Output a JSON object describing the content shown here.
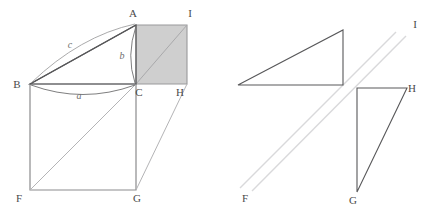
{
  "figure": {
    "canvas": {
      "width": 440,
      "height": 217
    },
    "colors": {
      "stroke_dark": "#58585a",
      "stroke_mid": "#8b8b8d",
      "stroke_light": "#c9c9cb",
      "shade_fill": "#cfcfcf",
      "shade_stroke": "#9a9a9c",
      "label_color": "#4a4a4a",
      "side_label_color": "#6e6e6e",
      "background": "#ffffff"
    }
  },
  "left_figure": {
    "name": "assembled-dissection",
    "vertices": [
      {
        "id": "A",
        "label": "A",
        "x": 136,
        "y": 25,
        "label_x": 133,
        "label_y": 17
      },
      {
        "id": "B",
        "label": "B",
        "x": 30,
        "y": 84,
        "label_x": 17,
        "label_y": 88
      },
      {
        "id": "C",
        "label": "C",
        "x": 136,
        "y": 84,
        "label_x": 139,
        "label_y": 96
      },
      {
        "id": "F",
        "label": "F",
        "x": 30,
        "y": 190,
        "label_x": 19,
        "label_y": 202
      },
      {
        "id": "G",
        "label": "G",
        "x": 136,
        "y": 190,
        "label_x": 137,
        "label_y": 202
      },
      {
        "id": "H",
        "label": "H",
        "x": 187,
        "y": 84,
        "label_x": 180,
        "label_y": 96
      },
      {
        "id": "I",
        "label": "I",
        "x": 187,
        "y": 25,
        "label_x": 190,
        "label_y": 17
      }
    ],
    "shaded_square": {
      "name": "square-on-side-b",
      "points": "136,25 187,25 187,84 136,84",
      "diagonal": {
        "from": "C",
        "to": "I",
        "x1": 136,
        "y1": 84,
        "x2": 187,
        "y2": 25
      }
    },
    "big_square": {
      "name": "square-on-side-a",
      "points": "30,84 136,84 136,190 30,190",
      "diagonal": {
        "from": "F",
        "to": "C",
        "x1": 30,
        "y1": 190,
        "x2": 136,
        "y2": 84
      }
    },
    "triangle": {
      "name": "right-triangle-abc",
      "points": "30,84 136,25 136,84"
    },
    "segments": [
      {
        "name": "segment-g-h",
        "x1": 136,
        "y1": 190,
        "x2": 187,
        "y2": 84
      },
      {
        "name": "segment-b-a",
        "x1": 30,
        "y1": 84,
        "x2": 136,
        "y2": 25
      }
    ],
    "arcs": [
      {
        "name": "arc-side-c",
        "label": "c",
        "d": "M 31,83 Q 80,36 135,24",
        "label_x": 70,
        "label_y": 48
      },
      {
        "name": "arc-side-b",
        "label": "b",
        "d": "M 136,26 Q 126,56 135,83",
        "label_x": 122,
        "label_y": 59
      },
      {
        "name": "arc-side-a",
        "label": "a",
        "d": "M 31,85 Q 83,104 135,85",
        "label_x": 79,
        "label_y": 99
      }
    ]
  },
  "right_figure": {
    "name": "exploded-dissection",
    "vertices": [
      {
        "id": "F",
        "label": "F",
        "x": 248,
        "y": 190,
        "label_x": 245,
        "label_y": 202
      },
      {
        "id": "G",
        "label": "G",
        "x": 357,
        "y": 192,
        "label_x": 353,
        "label_y": 204
      },
      {
        "id": "H",
        "label": "H",
        "x": 407,
        "y": 88,
        "label_x": 412,
        "label_y": 92
      },
      {
        "id": "I",
        "label": "I",
        "x": 414,
        "y": 36,
        "label_x": 415,
        "label_y": 28
      }
    ],
    "upper_triangle": {
      "name": "upper-right-triangle",
      "points": "238,85 343,85 343,30"
    },
    "lower_triangle": {
      "name": "lower-right-triangle",
      "points": "357,88 407,88 357,192"
    },
    "parallel_band": [
      {
        "name": "band-line-upper",
        "x1": 252,
        "y1": 191,
        "x2": 406,
        "y2": 36
      },
      {
        "name": "band-line-lower",
        "x1": 240,
        "y1": 188,
        "x2": 396,
        "y2": 32
      }
    ]
  }
}
